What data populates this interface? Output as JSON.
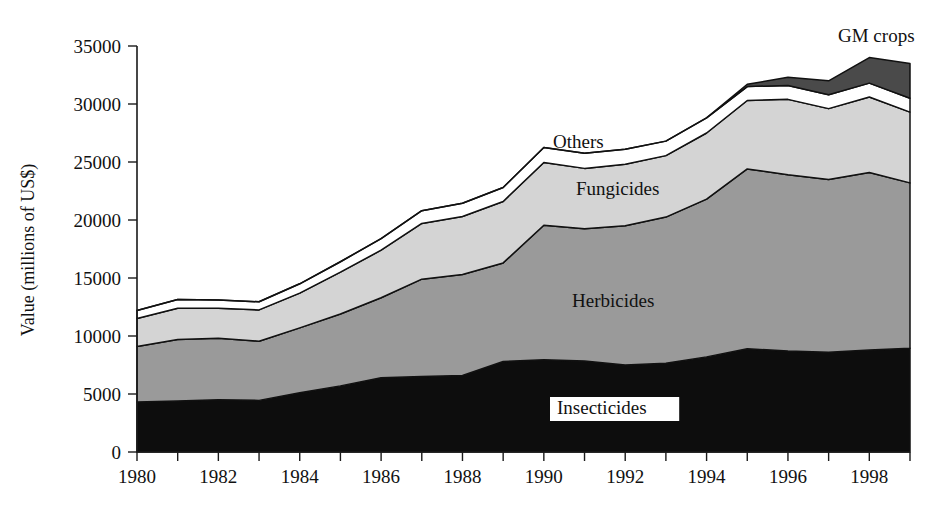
{
  "chart_data": {
    "type": "area",
    "title": "",
    "xlabel": "",
    "ylabel": "Value (millions of US$)",
    "x": [
      1980,
      1981,
      1982,
      1983,
      1984,
      1985,
      1986,
      1987,
      1988,
      1989,
      1990,
      1991,
      1992,
      1993,
      1994,
      1995,
      1996,
      1997,
      1998,
      1999
    ],
    "xlim": [
      1980,
      1999
    ],
    "ylim": [
      0,
      35000
    ],
    "yticks": [
      0,
      5000,
      10000,
      15000,
      20000,
      25000,
      30000,
      35000
    ],
    "ytick_labels": [
      "0",
      "5000",
      "10000",
      "15000",
      "20000",
      "25000",
      "30000",
      "35000"
    ],
    "xticks": [
      1980,
      1981,
      1982,
      1983,
      1984,
      1985,
      1986,
      1987,
      1988,
      1989,
      1990,
      1991,
      1992,
      1993,
      1994,
      1995,
      1996,
      1997,
      1998,
      1999
    ],
    "xtick_labels_shown": [
      "1980",
      "1982",
      "1984",
      "1986",
      "1988",
      "1990",
      "1992",
      "1994",
      "1996",
      "1998"
    ],
    "grid": false,
    "legend": "inline-annotations",
    "stacked": true,
    "series": [
      {
        "name": "Insecticides",
        "color": "#0d0d0d",
        "values": [
          4300,
          4400,
          4500,
          4450,
          5100,
          5700,
          6400,
          6500,
          6600,
          7800,
          7950,
          7850,
          7500,
          7650,
          8200,
          8900,
          8700,
          8600,
          8800,
          8950
        ]
      },
      {
        "name": "Herbicides",
        "color": "#9a9a9a",
        "values": [
          4800,
          5300,
          5300,
          5100,
          5600,
          6200,
          6900,
          8400,
          8700,
          8500,
          11600,
          11400,
          12000,
          12600,
          13600,
          15500,
          15200,
          14900,
          15300,
          14250
        ]
      },
      {
        "name": "Fungicides",
        "color": "#d4d4d4",
        "values": [
          2400,
          2700,
          2600,
          2700,
          3000,
          3600,
          4100,
          4800,
          5000,
          5300,
          5400,
          5200,
          5300,
          5300,
          5700,
          5900,
          6500,
          6100,
          6500,
          6100
        ]
      },
      {
        "name": "Others",
        "color": "#ffffff",
        "values": [
          700,
          750,
          700,
          700,
          800,
          900,
          1000,
          1100,
          1150,
          1200,
          1300,
          1300,
          1300,
          1250,
          1300,
          1200,
          1200,
          1200,
          1200,
          1200
        ]
      },
      {
        "name": "GM crops",
        "color": "#4a4a4a",
        "values": [
          0,
          0,
          0,
          0,
          0,
          0,
          0,
          0,
          0,
          0,
          0,
          0,
          0,
          0,
          0,
          200,
          700,
          1200,
          2200,
          3000
        ]
      }
    ],
    "annotations": [
      {
        "text": "GM crops",
        "x": 838,
        "y": 42,
        "boxed": false
      },
      {
        "text": "Others",
        "x": 553,
        "y": 148,
        "boxed": false
      },
      {
        "text": "Fungicides",
        "x": 576,
        "y": 195,
        "boxed": false
      },
      {
        "text": "Herbicides",
        "x": 572,
        "y": 307,
        "boxed": false
      },
      {
        "text": "Insecticides",
        "x": 557,
        "y": 414,
        "boxed": true
      }
    ]
  }
}
